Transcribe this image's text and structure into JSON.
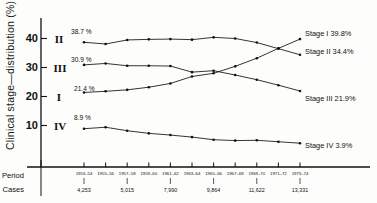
{
  "chart_data": {
    "type": "line",
    "title": "",
    "ylabel": "Clinical stage—distribution (%)",
    "xlabel": "",
    "ylim": [
      0,
      45
    ],
    "yticks": [
      10,
      20,
      30,
      40
    ],
    "grid": false,
    "legend_position": "right-end-labels",
    "categories": [
      "1953–54",
      "1955–56",
      "1957–58",
      "1959–60",
      "1961–62",
      "1963–64",
      "1965–66",
      "1967–68",
      "1969–70",
      "1971–72",
      "1973–74"
    ],
    "series": [
      {
        "name": "Stage II",
        "roman": "II",
        "start_label": "38.7 %",
        "end_label": "Stage II 34.4%",
        "start_value": 38.7,
        "end_value": 34.4,
        "values": [
          38.7,
          38.1,
          39.5,
          39.7,
          39.8,
          39.6,
          40.4,
          40.0,
          38.6,
          36.5,
          34.4
        ]
      },
      {
        "name": "Stage III",
        "roman": "III",
        "start_label": "30.9 %",
        "end_label": "Stage III 21.9%",
        "start_value": 30.9,
        "end_value": 21.9,
        "values": [
          30.9,
          31.4,
          30.6,
          30.6,
          30.5,
          28.4,
          28.9,
          27.4,
          25.8,
          23.9,
          21.9
        ]
      },
      {
        "name": "Stage I",
        "roman": "I",
        "start_label": "21.4 %",
        "end_label": "Stage I 39.8%",
        "start_value": 21.4,
        "end_value": 39.8,
        "values": [
          21.4,
          21.8,
          22.3,
          23.2,
          24.5,
          26.9,
          28.0,
          30.4,
          33.2,
          36.6,
          39.8
        ]
      },
      {
        "name": "Stage IV",
        "roman": "IV",
        "start_label": "8.9 %",
        "end_label": "Stage IV 3.9%",
        "start_value": 8.9,
        "end_value": 3.9,
        "values": [
          8.9,
          9.4,
          8.2,
          7.3,
          6.7,
          6.0,
          5.1,
          4.8,
          4.9,
          4.4,
          3.9
        ]
      }
    ],
    "table_rows": [
      {
        "label": "Period",
        "values": [
          "1953–54",
          "1955–56",
          "1957–58",
          "1959–60",
          "1961–62",
          "1963–64",
          "1965–66",
          "1967–68",
          "1969–70",
          "1971–72",
          "1973–74"
        ]
      },
      {
        "label": "Cases",
        "values": [
          "4,253",
          "",
          "5,015",
          "",
          "7,990",
          "",
          "9,864",
          "",
          "11,622",
          "",
          "13,331"
        ]
      }
    ],
    "colors": {
      "ink": "#111111",
      "background": "#fdfdfb"
    }
  }
}
